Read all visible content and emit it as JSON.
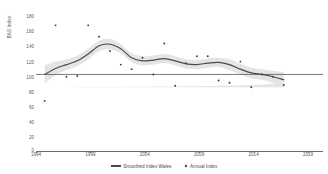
{
  "chart_data": {
    "type": "line",
    "title": "",
    "xlabel": "",
    "ylabel": "BAS Index",
    "xlim": [
      1993.2,
      2019.6
    ],
    "ylim": [
      0,
      180
    ],
    "yticks": [
      0,
      20,
      40,
      60,
      80,
      100,
      120,
      140,
      160,
      180
    ],
    "xticks": [
      1994,
      1999,
      2004,
      2009,
      2014,
      2019
    ],
    "grid": false,
    "legend_position": "bottom-center",
    "reference_line": {
      "y": 100,
      "color": "#595959"
    },
    "series": [
      {
        "name": "Smoothed Index Wales",
        "type": "line",
        "color": "#4a4a4a",
        "x": [
          1994,
          1995,
          1996,
          1997,
          1998,
          1999,
          2000,
          2001,
          2002,
          2003,
          2004,
          2005,
          2006,
          2007,
          2008,
          2009,
          2010,
          2011,
          2012,
          2013,
          2014,
          2015,
          2016
        ],
        "values": [
          100,
          108,
          113,
          118,
          127,
          138,
          140,
          134,
          122,
          118,
          119,
          121,
          118,
          114,
          113,
          115,
          116,
          113,
          107,
          102,
          100,
          97,
          93
        ]
      },
      {
        "name": "Annual Index",
        "type": "scatter",
        "color": "#3a3a3a",
        "x": [
          1994,
          1995,
          1996,
          1997,
          1998,
          1999,
          2000,
          2001,
          2002,
          2003,
          2004,
          2005,
          2006,
          2007,
          2008,
          2009,
          2010,
          2011,
          2012,
          2013,
          2014,
          2015,
          2016
        ],
        "values": [
          65,
          165,
          97,
          98,
          165,
          150,
          131,
          113,
          107,
          122,
          100,
          141,
          85,
          115,
          124,
          124,
          92,
          89,
          117,
          83,
          100,
          97,
          86
        ]
      }
    ],
    "confidence_band": {
      "name": "confidence-interval",
      "color": "#e3e3e3",
      "x": [
        1994,
        1995,
        1996,
        1997,
        1998,
        1999,
        2000,
        2001,
        2002,
        2003,
        2004,
        2005,
        2006,
        2007,
        2008,
        2009,
        2010,
        2011,
        2012,
        2013,
        2014,
        2015,
        2016
      ],
      "upper": [
        112,
        117,
        120,
        125,
        134,
        145,
        147,
        140,
        128,
        124,
        125,
        127,
        124,
        120,
        119,
        121,
        122,
        120,
        114,
        109,
        107,
        105,
        103
      ],
      "lower": [
        88,
        99,
        106,
        111,
        120,
        131,
        133,
        128,
        116,
        112,
        113,
        115,
        112,
        108,
        107,
        109,
        110,
        106,
        100,
        95,
        93,
        89,
        83
      ]
    }
  },
  "legend": {
    "items": [
      {
        "label": "Smoothed Index Wales",
        "marker": "line"
      },
      {
        "label": "Annual Index",
        "marker": "dot"
      }
    ]
  }
}
